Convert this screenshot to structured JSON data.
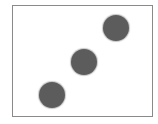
{
  "die": {
    "face_value": 3,
    "pip_count": 3,
    "arrangement": "diagonal bottom-left to top-right",
    "pip_color": "#5c5c5c",
    "border_color": "#8a8a8a",
    "background_color": "#ffffff"
  }
}
